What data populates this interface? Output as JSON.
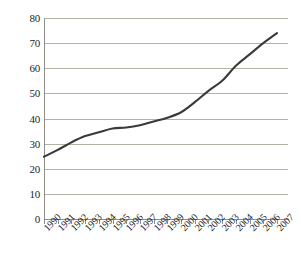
{
  "chart_data": {
    "type": "line",
    "title": "",
    "subtitle": "",
    "xlabel": "",
    "ylabel": "",
    "categories": [
      "1990",
      "1991",
      "1992",
      "1993",
      "1994",
      "1995",
      "1996",
      "1997",
      "1998",
      "1999",
      "2000",
      "2001",
      "2002",
      "2003",
      "2004",
      "2005",
      "2006",
      "2007"
    ],
    "values": [
      24.8,
      27.5,
      30.5,
      33.0,
      34.5,
      36.0,
      36.4,
      37.3,
      38.8,
      40.3,
      42.5,
      46.5,
      51.0,
      55.0,
      61.0,
      65.5,
      70.0,
      74.0
    ],
    "series": [
      {
        "name": "series-1",
        "values": [
          24.8,
          27.5,
          30.5,
          33.0,
          34.5,
          36.0,
          36.4,
          37.3,
          38.8,
          40.3,
          42.5,
          46.5,
          51.0,
          55.0,
          61.0,
          65.5,
          70.0,
          74.0
        ],
        "color": "#3a3a38"
      }
    ],
    "ylim": [
      0,
      80
    ],
    "yticks": [
      0,
      10,
      20,
      30,
      40,
      50,
      60,
      70,
      80
    ],
    "ytick_labels": [
      "0",
      "10",
      "20",
      "30",
      "40",
      "50",
      "60",
      "70",
      "80"
    ],
    "grid": true,
    "grid_axis": "y",
    "legend": false,
    "legend_position": "none",
    "xtick_rotation": -45,
    "annotations": []
  },
  "style": {
    "background_color": "#ffffff",
    "gridline_color": "#b5b2a8",
    "axis_color": "#8f8d85",
    "line_color": "#3a3a38",
    "text_color": "#262626"
  }
}
